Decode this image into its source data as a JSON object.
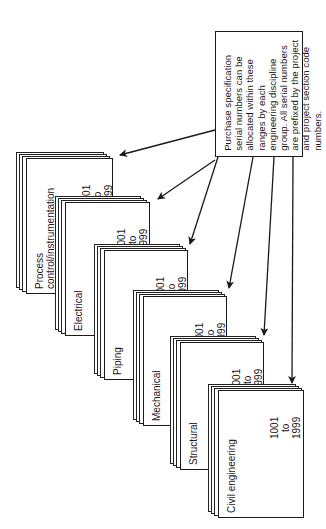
{
  "note": {
    "text": "Purchase specification serial numbers can be allocated within these ranges by each engineering discipline group. All serial numbers are prefixed by the project and project section code numbers."
  },
  "stacks": [
    {
      "label": "Process control/instrumentation",
      "label_lines": [
        "Process",
        "control/instrumentation"
      ],
      "range_from": "6001",
      "range_to_word": "to",
      "range_to": "6999"
    },
    {
      "label": "Electrical",
      "label_lines": [
        "Electrical"
      ],
      "range_from": "5001",
      "range_to_word": "to",
      "range_to": "5999"
    },
    {
      "label": "Piping",
      "label_lines": [
        "Piping"
      ],
      "range_from": "4001",
      "range_to_word": "to",
      "range_to": "4999"
    },
    {
      "label": "Mechanical",
      "label_lines": [
        "Mechanical"
      ],
      "range_from": "3001",
      "range_to_word": "to",
      "range_to": "3999"
    },
    {
      "label": "Structural",
      "label_lines": [
        "Structural"
      ],
      "range_from": "2001",
      "range_to_word": "to",
      "range_to": "2999"
    },
    {
      "label": "Civil engineering",
      "label_lines": [
        "Civil engineering"
      ],
      "range_from": "1001",
      "range_to_word": "to",
      "range_to": "1999"
    }
  ],
  "colors": {
    "ink": "#1a1a1a",
    "paper": "#ffffff"
  }
}
